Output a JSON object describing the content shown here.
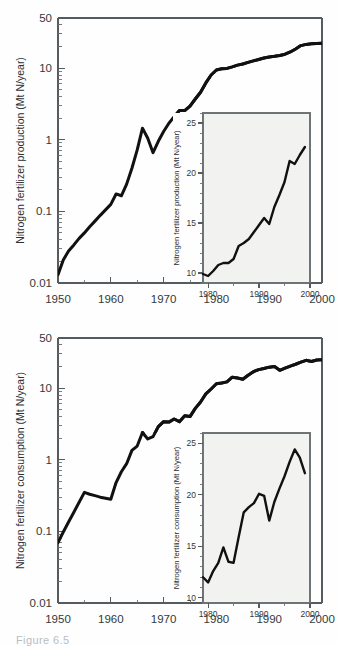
{
  "figure": {
    "caption_fragment": "Figure 6.5",
    "background_color": "#fefefe",
    "line_color": "#111111",
    "axis_color": "#555b5e",
    "inset_fill": "#f2f2f0"
  },
  "chart_data": [
    {
      "id": "production",
      "type": "line",
      "title": "",
      "xlabel": "",
      "ylabel": "Nitrogen fertilizer production (Mt N/year)",
      "yscale": "log",
      "ylim": [
        0.01,
        50
      ],
      "xlim": [
        1950,
        2000
      ],
      "grid": false,
      "legend": "none",
      "ytick_labels": [
        "0.01",
        "0.1",
        "1",
        "10",
        "50"
      ],
      "ytick_values": [
        0.01,
        0.1,
        1,
        10,
        50
      ],
      "xtick_labels": [
        "1950",
        "1960",
        "1970",
        "1980",
        "1990",
        "2000"
      ],
      "xtick_values": [
        1950,
        1960,
        1970,
        1980,
        1990,
        2000
      ],
      "x": [
        1950,
        1951,
        1952,
        1953,
        1954,
        1955,
        1956,
        1957,
        1958,
        1959,
        1960,
        1961,
        1962,
        1963,
        1964,
        1965,
        1966,
        1967,
        1968,
        1969,
        1970,
        1971,
        1972,
        1973,
        1974,
        1975,
        1976,
        1977,
        1978,
        1979,
        1980,
        1981,
        1982,
        1983,
        1984,
        1985,
        1986,
        1987,
        1988,
        1989,
        1990,
        1991,
        1992,
        1993,
        1994,
        1995,
        1996,
        1997,
        1998,
        1999,
        2000
      ],
      "y": [
        0.013,
        0.021,
        0.028,
        0.034,
        0.042,
        0.05,
        0.061,
        0.073,
        0.088,
        0.105,
        0.125,
        0.175,
        0.165,
        0.24,
        0.4,
        0.72,
        1.45,
        1.05,
        0.66,
        0.95,
        1.3,
        1.7,
        2.1,
        2.55,
        2.55,
        2.95,
        3.7,
        4.6,
        6.2,
        8.0,
        9.4,
        9.8,
        9.9,
        10.4,
        11.0,
        11.4,
        12.0,
        12.6,
        13.2,
        13.8,
        14.3,
        14.6,
        15.0,
        15.6,
        16.8,
        18.5,
        20.6,
        21.4,
        21.8,
        22.1,
        22.2
      ],
      "inset": {
        "type": "line",
        "ylabel": "Nitrogen fertilizer production (Mt N/year)",
        "yscale": "linear",
        "ylim": [
          9,
          26
        ],
        "xlim": [
          1979,
          2000
        ],
        "ytick_labels": [
          "10",
          "15",
          "20",
          "25"
        ],
        "ytick_values": [
          10,
          15,
          20,
          25
        ],
        "xtick_labels": [
          "1980",
          "1990",
          "2000"
        ],
        "xtick_values": [
          1980,
          1990,
          2000
        ],
        "x": [
          1979,
          1980,
          1981,
          1982,
          1983,
          1984,
          1985,
          1986,
          1987,
          1988,
          1989,
          1990,
          1991,
          1992,
          1993,
          1994,
          1995,
          1996,
          1997,
          1998,
          1999
        ],
        "y": [
          9.9,
          9.7,
          10.2,
          10.8,
          11.0,
          11.0,
          11.4,
          12.7,
          13.0,
          13.4,
          14.1,
          14.8,
          15.5,
          14.9,
          16.6,
          17.8,
          19.1,
          21.2,
          20.9,
          21.8,
          22.6
        ]
      }
    },
    {
      "id": "consumption",
      "type": "line",
      "title": "",
      "xlabel": "",
      "ylabel": "Nitrogen fertilizer consumption (Mt N/year)",
      "yscale": "log",
      "ylim": [
        0.01,
        50
      ],
      "xlim": [
        1950,
        2000
      ],
      "grid": false,
      "legend": "none",
      "ytick_labels": [
        "0.01",
        "0.1",
        "1",
        "10",
        "50"
      ],
      "ytick_values": [
        0.01,
        0.1,
        1,
        10,
        50
      ],
      "xtick_labels": [
        "1950",
        "1960",
        "1970",
        "1980",
        "1990",
        "2000"
      ],
      "xtick_values": [
        1950,
        1960,
        1970,
        1980,
        1990,
        2000
      ],
      "x": [
        1950,
        1951,
        1952,
        1953,
        1954,
        1955,
        1956,
        1957,
        1958,
        1959,
        1960,
        1961,
        1962,
        1963,
        1964,
        1965,
        1966,
        1967,
        1968,
        1969,
        1970,
        1971,
        1972,
        1973,
        1974,
        1975,
        1976,
        1977,
        1978,
        1979,
        1980,
        1981,
        1982,
        1983,
        1984,
        1985,
        1986,
        1987,
        1988,
        1989,
        1990,
        1991,
        1992,
        1993,
        1994,
        1995,
        1996,
        1997,
        1998,
        1999,
        2000
      ],
      "y": [
        0.07,
        0.098,
        0.135,
        0.185,
        0.255,
        0.35,
        0.33,
        0.315,
        0.3,
        0.29,
        0.28,
        0.48,
        0.68,
        0.88,
        1.35,
        1.55,
        2.4,
        1.95,
        2.1,
        2.9,
        3.4,
        3.35,
        3.7,
        3.4,
        4.1,
        4.0,
        5.2,
        6.4,
        8.3,
        9.7,
        11.5,
        11.8,
        12.2,
        14.2,
        13.8,
        13.3,
        15.1,
        16.9,
        18.1,
        18.8,
        19.6,
        20.0,
        17.7,
        19.0,
        20.3,
        21.5,
        23.0,
        24.4,
        23.5,
        24.6,
        24.8
      ],
      "inset": {
        "type": "line",
        "ylabel": "Nitrogen fertilizer consumption (Mt N/year)",
        "yscale": "linear",
        "ylim": [
          9.5,
          26
        ],
        "xlim": [
          1979,
          2000
        ],
        "ytick_labels": [
          "10",
          "15",
          "20",
          "25"
        ],
        "ytick_values": [
          10,
          15,
          20,
          25
        ],
        "xtick_labels": [
          "1980",
          "1990",
          "2000"
        ],
        "xtick_values": [
          1980,
          1990,
          2000
        ],
        "x": [
          1979,
          1980,
          1981,
          1982,
          1983,
          1984,
          1985,
          1986,
          1987,
          1988,
          1989,
          1990,
          1991,
          1992,
          1993,
          1994,
          1995,
          1996,
          1997,
          1998,
          1999
        ],
        "y": [
          12.0,
          11.5,
          12.6,
          13.4,
          14.9,
          13.5,
          13.4,
          15.9,
          18.3,
          18.8,
          19.2,
          20.1,
          19.9,
          17.5,
          19.3,
          20.6,
          21.8,
          23.2,
          24.4,
          23.6,
          22.1
        ]
      }
    }
  ]
}
